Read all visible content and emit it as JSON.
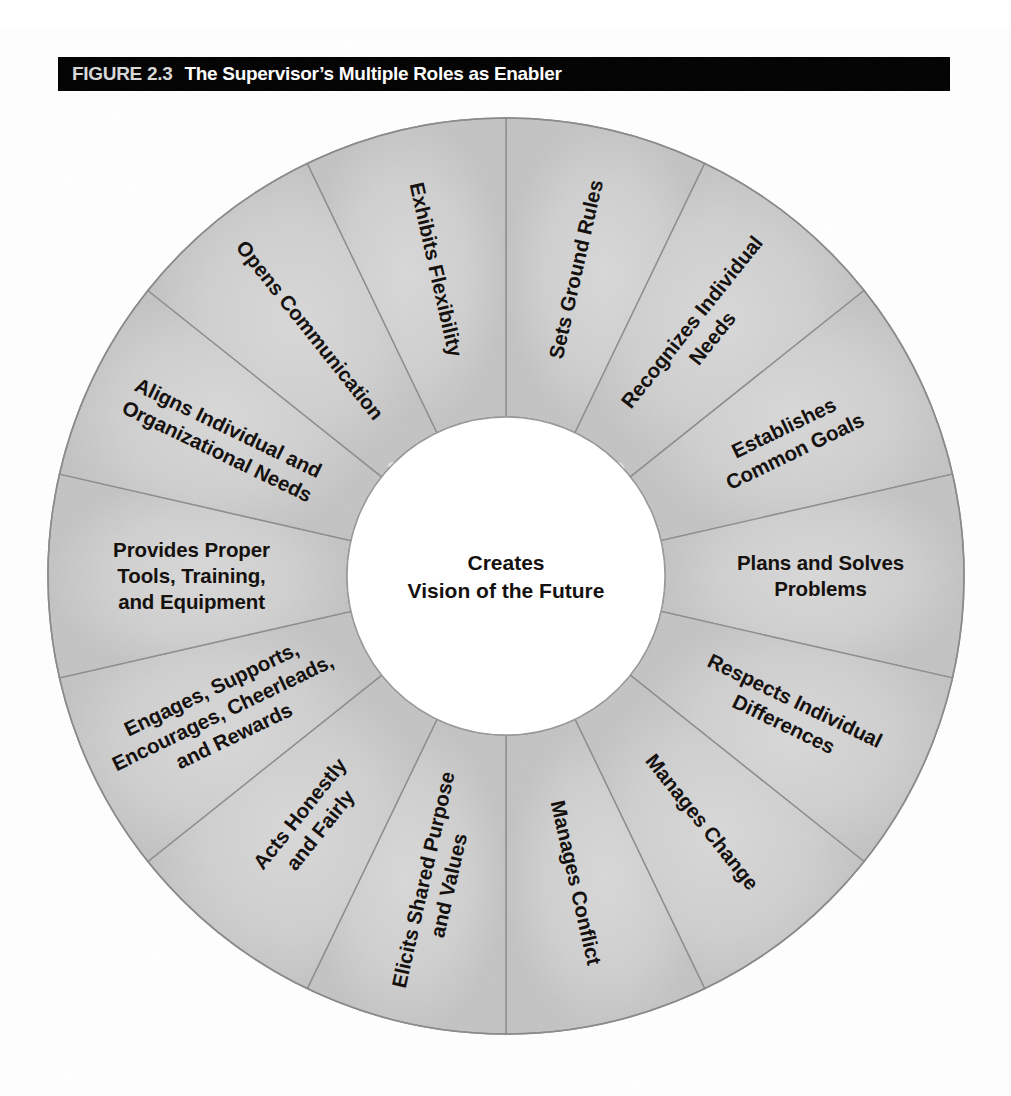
{
  "figure": {
    "number": "FIGURE 2.3",
    "title": "The Supervisor’s Multiple Roles as Enabler"
  },
  "hub": {
    "line1": "Creates",
    "line2": "Vision of the Future"
  },
  "bleed_through": {
    "line1": "CHARACTERISTICS",
    "line2": "SUCCESS"
  },
  "colors": {
    "bar_background": "#000000",
    "bar_text": "#ffffff",
    "segment_fill_light": "#d6d6d6",
    "segment_fill_dark": "#c4c4c4",
    "segment_stroke": "#8d8d8d",
    "hub_fill": "#ffffff",
    "label_text": "#15110f",
    "page_background": "#ffffff"
  },
  "chart_data": {
    "type": "pie",
    "title": "The Supervisor’s Multiple Roles as Enabler",
    "center_label": "Creates Vision of the Future",
    "legend": "none",
    "segment_count": 14,
    "equal_slices": true,
    "slice_degrees": 25.714,
    "start_angle_degrees": 0,
    "inner_radius_px": 159,
    "outer_radius_px": 458,
    "categories": [
      "Sets Ground Rules",
      "Recognizes Individual Needs",
      "Establishes Common Goals",
      "Plans and Solves Problems",
      "Respects Individual Differences",
      "Manages Change",
      "Manages Conflict",
      "Elicits Shared Purpose and Values",
      "Acts Honestly and Fairly",
      "Engages, Supports, Encourages, Cheerleads, and Rewards",
      "Provides Proper Tools, Training, and Equipment",
      "Aligns Individual and Organizational Needs",
      "Opens Communication",
      "Exhibits Flexibility"
    ],
    "values": [
      1,
      1,
      1,
      1,
      1,
      1,
      1,
      1,
      1,
      1,
      1,
      1,
      1,
      1
    ]
  },
  "segments": [
    {
      "id": "sets-ground-rules",
      "lines": [
        "Sets Ground Rules"
      ]
    },
    {
      "id": "recognizes-individual-needs",
      "lines": [
        "Recognizes Individual",
        "Needs"
      ]
    },
    {
      "id": "establishes-common-goals",
      "lines": [
        "Establishes",
        "Common Goals"
      ]
    },
    {
      "id": "plans-and-solves-problems",
      "lines": [
        "Plans and Solves",
        "Problems"
      ]
    },
    {
      "id": "respects-individual-differences",
      "lines": [
        "Respects Individual",
        "Differences"
      ]
    },
    {
      "id": "manages-change",
      "lines": [
        "Manages Change"
      ]
    },
    {
      "id": "manages-conflict",
      "lines": [
        "Manages Conflict"
      ]
    },
    {
      "id": "elicits-shared-purpose-and-values",
      "lines": [
        "Elicits Shared Purpose",
        "and Values"
      ]
    },
    {
      "id": "acts-honestly-and-fairly",
      "lines": [
        "Acts Honestly",
        "and Fairly"
      ]
    },
    {
      "id": "engages-supports-encourages-cheerleads-and-rewards",
      "lines": [
        "Engages, Supports,",
        "Encourages, Cheerleads,",
        "and Rewards"
      ]
    },
    {
      "id": "provides-proper-tools-training-and-equipment",
      "lines": [
        "Provides Proper",
        "Tools, Training,",
        "and Equipment"
      ]
    },
    {
      "id": "aligns-individual-and-organizational-needs",
      "lines": [
        "Aligns Individual and",
        "Organizational Needs"
      ]
    },
    {
      "id": "opens-communication",
      "lines": [
        "Opens Communication"
      ]
    },
    {
      "id": "exhibits-flexibility",
      "lines": [
        "Exhibits Flexibility"
      ]
    }
  ]
}
